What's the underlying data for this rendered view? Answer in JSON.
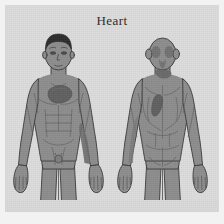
{
  "panel": {
    "title": "Heart",
    "background_color": "#dcdcdc",
    "outer_margin_color": "#f2f2f2"
  },
  "palette": {
    "body_fill": "#8d8d8d",
    "body_outline": "#3a3a3a",
    "body_shadow": "#7b7b7b",
    "highlight_fill": "#5f5f5f",
    "hair_fill": "#2e2e2e",
    "title_color": "#2b2b2b",
    "detail_line": "#5a5a5a"
  },
  "figures": [
    {
      "id": "anterior",
      "view_label": "Anterior view",
      "body_region": "male full body, cropped at mid-thigh",
      "highlights": [
        {
          "name": "heart-referred-pain-chest",
          "label": "Left chest / precordium",
          "color": "#5f5f5f"
        },
        {
          "name": "heart-referred-pain-left-arm",
          "label": "Left inner arm",
          "color": "#6c6c6c"
        }
      ]
    },
    {
      "id": "posterior",
      "view_label": "Posterior view",
      "body_region": "male full body, cropped at mid-thigh",
      "highlights": [
        {
          "name": "heart-referred-pain-upper-back",
          "label": "Left upper back / scapular region",
          "color": "#5f5f5f"
        },
        {
          "name": "heart-referred-pain-neck",
          "label": "Base of neck",
          "color": "#686868"
        }
      ]
    }
  ]
}
